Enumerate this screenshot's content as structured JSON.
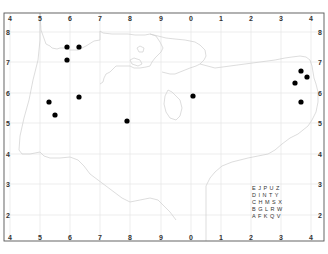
{
  "map": {
    "type": "distribution-grid-map",
    "frame": {
      "left": 4,
      "top": 13,
      "right": 324,
      "bottom": 241
    },
    "colors": {
      "background": "#ffffff",
      "frame": "#555555",
      "grid": "#e6e6e6",
      "coastline": "#cfcfcf",
      "point": "#000000"
    },
    "top_labels": [
      {
        "label": "4",
        "x": 10
      },
      {
        "label": "5",
        "x": 40
      },
      {
        "label": "6",
        "x": 70
      },
      {
        "label": "7",
        "x": 100
      },
      {
        "label": "8",
        "x": 130
      },
      {
        "label": "9",
        "x": 161
      },
      {
        "label": "0",
        "x": 191
      },
      {
        "label": "1",
        "x": 221
      },
      {
        "label": "2",
        "x": 251
      },
      {
        "label": "3",
        "x": 281
      },
      {
        "label": "4",
        "x": 311
      }
    ],
    "bottom_labels": [
      {
        "label": "4",
        "x": 10
      },
      {
        "label": "5",
        "x": 40
      },
      {
        "label": "6",
        "x": 70
      },
      {
        "label": "7",
        "x": 100
      },
      {
        "label": "8",
        "x": 130
      },
      {
        "label": "9",
        "x": 161
      },
      {
        "label": "0",
        "x": 191
      },
      {
        "label": "1",
        "x": 221
      },
      {
        "label": "2",
        "x": 251
      },
      {
        "label": "3",
        "x": 281
      },
      {
        "label": "4",
        "x": 311
      }
    ],
    "left_labels": [
      {
        "label": "8",
        "y": 32
      },
      {
        "label": "7",
        "y": 62
      },
      {
        "label": "6",
        "y": 93
      },
      {
        "label": "5",
        "y": 123
      },
      {
        "label": "4",
        "y": 154
      },
      {
        "label": "3",
        "y": 184
      },
      {
        "label": "2",
        "y": 215
      }
    ],
    "right_labels": [
      {
        "label": "8",
        "y": 32
      },
      {
        "label": "7",
        "y": 62
      },
      {
        "label": "6",
        "y": 93
      },
      {
        "label": "5",
        "y": 123
      },
      {
        "label": "4",
        "y": 154
      },
      {
        "label": "3",
        "y": 184
      },
      {
        "label": "2",
        "y": 215
      }
    ],
    "points": [
      {
        "x": 67,
        "y": 47
      },
      {
        "x": 79,
        "y": 47
      },
      {
        "x": 67,
        "y": 60
      },
      {
        "x": 49,
        "y": 102
      },
      {
        "x": 55,
        "y": 115
      },
      {
        "x": 79,
        "y": 97
      },
      {
        "x": 127,
        "y": 121
      },
      {
        "x": 193,
        "y": 96
      },
      {
        "x": 301,
        "y": 71
      },
      {
        "x": 307,
        "y": 77
      },
      {
        "x": 295,
        "y": 83
      },
      {
        "x": 301,
        "y": 102
      }
    ],
    "legend_grid": {
      "rows": [
        "E J P U Z",
        "D I N T Y",
        "C H M S X",
        "B G L R W",
        "A F K Q V"
      ],
      "x": 252,
      "y": 190
    }
  }
}
